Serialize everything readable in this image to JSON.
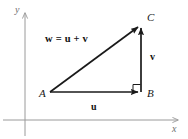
{
  "figure": {
    "background_color": "#ffffff",
    "axes": {
      "color": "#9a9a9a",
      "x_label": "x",
      "y_label": "y"
    },
    "vector_color": "#1a1a1a",
    "points": [
      {
        "id": "A",
        "label": "A",
        "x": 50,
        "y": 92
      },
      {
        "id": "B",
        "label": "B",
        "x": 141,
        "y": 92
      },
      {
        "id": "C",
        "label": "C",
        "x": 141,
        "y": 25
      }
    ],
    "vectors": [
      {
        "id": "u",
        "label": "u",
        "from": "A",
        "to": "B"
      },
      {
        "id": "v",
        "label": "v",
        "from": "B",
        "to": "C"
      },
      {
        "id": "w",
        "label": "w",
        "from": "A",
        "to": "C"
      }
    ],
    "equation": {
      "lhs": "w",
      "equals": "=",
      "term1": "u",
      "plus": "+",
      "term2": "v",
      "full": "w = u + v"
    },
    "right_angle_marker": {
      "at_point": "B",
      "visible": true
    }
  }
}
